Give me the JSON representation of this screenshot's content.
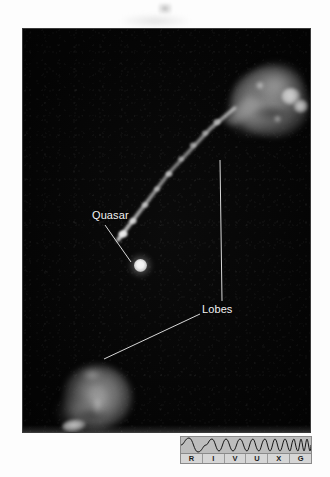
{
  "figure": {
    "kind": "astronomical-photograph"
  },
  "annotations": [
    {
      "id": "quasar",
      "label": "Quasar",
      "target": "bright point source at center of image"
    },
    {
      "id": "lobes",
      "label": "Lobes",
      "target": "two diffuse emission lobes, upper-right and lower-left"
    }
  ],
  "labels": {
    "quasar": "Quasar",
    "lobes": "Lobes"
  },
  "spectrum_bar": {
    "name": "RIVUXG electromagnetic spectrum indicator",
    "bands": [
      {
        "letter": "R",
        "name": "Radio"
      },
      {
        "letter": "I",
        "name": "Infrared"
      },
      {
        "letter": "V",
        "name": "Visible"
      },
      {
        "letter": "U",
        "name": "Ultraviolet"
      },
      {
        "letter": "X",
        "name": "X-ray"
      },
      {
        "letter": "G",
        "name": "Gamma ray"
      }
    ],
    "wave_icon": "increasing-frequency-wave",
    "background_color": "#c9c9c9",
    "letter_color": "#1b1b1b"
  },
  "colors": {
    "photo_background": "#050505",
    "emission_bright": "#ffffff",
    "emission_mid": "#a8a8a8",
    "label_text": "#f2f2f2",
    "page_background": "#ffffff"
  }
}
